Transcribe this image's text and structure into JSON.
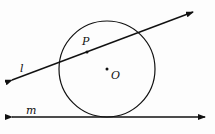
{
  "diagram": {
    "labels": {
      "line_l": "l",
      "line_m": "m",
      "point_P": "P",
      "point_O": "O"
    },
    "circle": {
      "cx": 107,
      "cy": 69,
      "r": 48
    },
    "line_l": {
      "x1": 12,
      "y1": 80,
      "x2": 193,
      "y2": 12
    },
    "line_m": {
      "x1": 12,
      "y1": 117,
      "x2": 205,
      "y2": 117
    },
    "points": {
      "P": {
        "x": 87,
        "y": 52
      },
      "O": {
        "x": 107,
        "y": 69
      }
    },
    "stroke_color": "#111111"
  }
}
